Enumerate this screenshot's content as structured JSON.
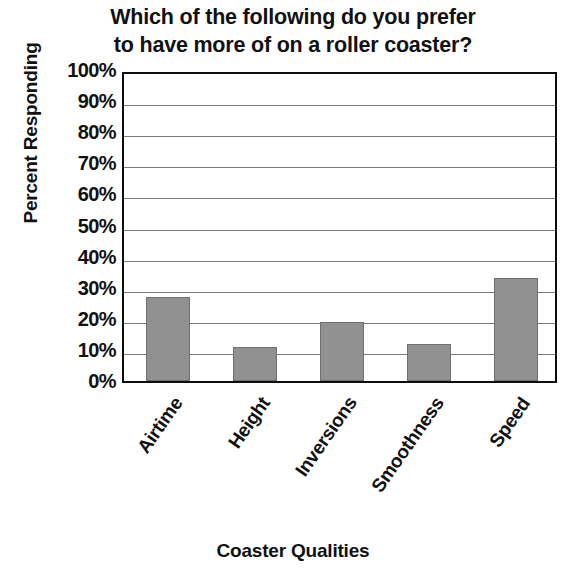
{
  "chart_data": {
    "type": "bar",
    "title": "Which of the following do you prefer to have more of on a roller coaster?",
    "title_lines": [
      "Which of the following do you prefer",
      "to have more of on a roller coaster?"
    ],
    "xlabel": "Coaster Qualities",
    "ylabel": "Percent Responding",
    "categories": [
      "Airtime",
      "Height",
      "Inversions",
      "Smoothness",
      "Speed"
    ],
    "values": [
      27,
      11,
      19,
      12,
      33
    ],
    "ylim": [
      0,
      100
    ],
    "ytick_labels": [
      "100%",
      "90%",
      "80%",
      "70%",
      "60%",
      "50%",
      "40%",
      "30%",
      "20%",
      "10%",
      "0%"
    ],
    "ytick_values": [
      100,
      90,
      80,
      70,
      60,
      50,
      40,
      30,
      20,
      10,
      0
    ],
    "grid": true,
    "legend": false,
    "bar_color": "#919191",
    "axis_color": "#0d0d0d",
    "grid_color": "#7a7a7a",
    "text_color": "#111111"
  }
}
